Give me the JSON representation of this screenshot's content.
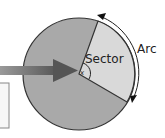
{
  "diagram": {
    "labels": {
      "sector": "Sector",
      "arc": "Arc",
      "angle": "x"
    },
    "colors": {
      "circle_fill": "#a9a9a9",
      "sector_fill": "#d9d9d9",
      "outline": "#333333",
      "arrow": "#6e6e6e",
      "background": "#ffffff"
    }
  }
}
